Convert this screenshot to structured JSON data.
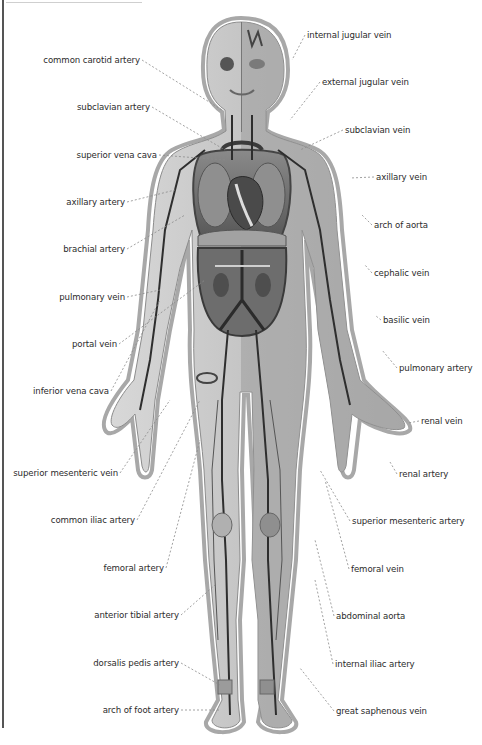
{
  "diagram": {
    "colors": {
      "background": "#ffffff",
      "text": "#2b2b2b",
      "leader": "#8a8a8a",
      "outline": "#9a9a9a",
      "vessel_dark": "#2e2e2e",
      "tissue": "#cfcfcf",
      "organ": "#6e6e6e"
    },
    "labels_left": [
      {
        "text": "common carotid artery",
        "x": 140,
        "y": 60
      },
      {
        "text": "subclavian artery",
        "x": 150,
        "y": 107
      },
      {
        "text": "superior vena cava",
        "x": 157,
        "y": 155
      },
      {
        "text": "axillary artery",
        "x": 125,
        "y": 202
      },
      {
        "text": "brachial artery",
        "x": 125,
        "y": 249
      },
      {
        "text": "pulmonary vein",
        "x": 125,
        "y": 297
      },
      {
        "text": "portal vein",
        "x": 117,
        "y": 344
      },
      {
        "text": "inferior vena cava",
        "x": 109,
        "y": 391
      },
      {
        "text": "superior mesenteric vein",
        "x": 118,
        "y": 473
      },
      {
        "text": "common iliac artery",
        "x": 135,
        "y": 520
      },
      {
        "text": "femoral artery",
        "x": 164,
        "y": 568
      },
      {
        "text": "anterior tibial artery",
        "x": 179,
        "y": 615
      },
      {
        "text": "dorsalis pedis artery",
        "x": 179,
        "y": 663
      },
      {
        "text": "arch of foot artery",
        "x": 179,
        "y": 710
      }
    ],
    "labels_right": [
      {
        "text": "internal jugular vein",
        "x": 307,
        "y": 35
      },
      {
        "text": "external jugular vein",
        "x": 322,
        "y": 82
      },
      {
        "text": "subclavian vein",
        "x": 345,
        "y": 130
      },
      {
        "text": "axillary vein",
        "x": 376,
        "y": 177
      },
      {
        "text": "arch of aorta",
        "x": 374,
        "y": 225
      },
      {
        "text": "cephalic vein",
        "x": 374,
        "y": 273
      },
      {
        "text": "basilic vein",
        "x": 383,
        "y": 320
      },
      {
        "text": "pulmonary artery",
        "x": 399,
        "y": 368
      },
      {
        "text": "renal vein",
        "x": 421,
        "y": 421
      },
      {
        "text": "renal artery",
        "x": 399,
        "y": 474
      },
      {
        "text": "superior mesenteric artery",
        "x": 352,
        "y": 521
      },
      {
        "text": "femoral vein",
        "x": 351,
        "y": 569
      },
      {
        "text": "abdominal aorta",
        "x": 336,
        "y": 616
      },
      {
        "text": "internal iliac artery",
        "x": 335,
        "y": 664
      },
      {
        "text": "great saphenous vein",
        "x": 336,
        "y": 711
      }
    ]
  }
}
